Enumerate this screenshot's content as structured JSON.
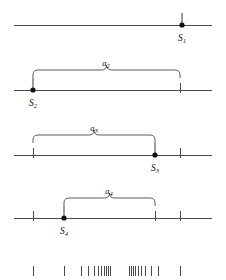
{
  "figure": {
    "type": "number-line-diagram",
    "width": 226,
    "height": 280,
    "background": "#ffffff",
    "line_color": "#4a4a4a",
    "dot_color": "#111111",
    "axis_x_start": 14,
    "axis_x_end": 212
  },
  "rows": [
    {
      "id": "row-1",
      "line_y": 25,
      "point": {
        "label": "S",
        "subscript": "1",
        "x": 182,
        "label_x": 182,
        "label_y": 41,
        "stem_top": 13
      },
      "ticks": [],
      "brace": null
    },
    {
      "id": "row-2",
      "line_y": 90,
      "point": {
        "label": "S",
        "subscript": "2",
        "x": 33,
        "label_x": 33,
        "label_y": 106,
        "stem_top": 78
      },
      "ticks": [
        {
          "x": 180
        }
      ],
      "brace": {
        "label": "a",
        "subscript": "2",
        "x_left": 33,
        "x_right": 180,
        "y_bottom": 78,
        "y_top": 70,
        "label_x": 106,
        "label_y": 66
      }
    },
    {
      "id": "row-3",
      "line_y": 155,
      "point": {
        "label": "S",
        "subscript": "3",
        "x": 155,
        "label_x": 155,
        "label_y": 171,
        "stem_top": 143
      },
      "ticks": [
        {
          "x": 33
        },
        {
          "x": 180
        }
      ],
      "brace": {
        "label": "a",
        "subscript": "3",
        "x_left": 33,
        "x_right": 155,
        "y_bottom": 143,
        "y_top": 135,
        "label_x": 94,
        "label_y": 131
      }
    },
    {
      "id": "row-4",
      "line_y": 218,
      "point": {
        "label": "S",
        "subscript": "4",
        "x": 64,
        "label_x": 64,
        "label_y": 234,
        "stem_top": 206
      },
      "ticks": [
        {
          "x": 33
        },
        {
          "x": 155
        },
        {
          "x": 180
        }
      ],
      "brace": {
        "label": "a",
        "subscript": "4",
        "x_left": 64,
        "x_right": 155,
        "y_bottom": 206,
        "y_top": 198,
        "label_x": 109,
        "label_y": 194
      }
    }
  ],
  "bottom_strip": {
    "id": "limit-tick-strip",
    "tick_top": 266,
    "tick_bottom": 276,
    "ticks": [
      {
        "x": 33
      },
      {
        "x": 64
      },
      {
        "x": 81
      },
      {
        "x": 88
      },
      {
        "x": 94
      },
      {
        "x": 98
      },
      {
        "x": 101
      },
      {
        "x": 104
      },
      {
        "x": 106
      },
      {
        "x": 108
      },
      {
        "x": 110
      },
      {
        "x": 129
      },
      {
        "x": 131
      },
      {
        "x": 133
      },
      {
        "x": 135
      },
      {
        "x": 138
      },
      {
        "x": 141
      },
      {
        "x": 145
      },
      {
        "x": 151
      },
      {
        "x": 158
      },
      {
        "x": 180
      }
    ]
  },
  "icons": {
    "dot": "filled-circle-marker",
    "brace": "curly-brace-horizontal",
    "tick": "vertical-tick-mark"
  }
}
